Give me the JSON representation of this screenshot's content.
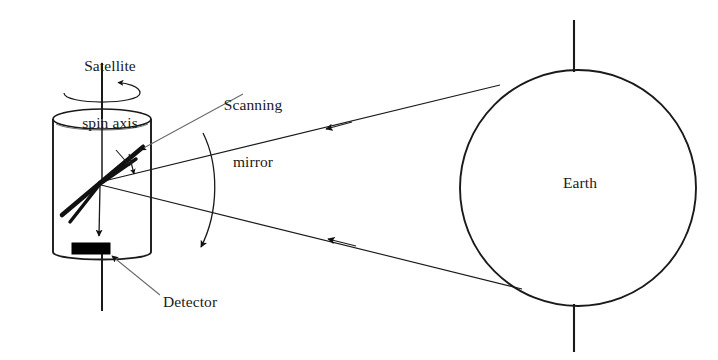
{
  "figure": {
    "background_color": "#ffffff",
    "stroke_color": "#1a1a1a",
    "fill_color": "#000000",
    "width": 718,
    "height": 360
  },
  "labels": {
    "satellite_spin_axis": "Satellite\nspin axis",
    "satellite_spin_axis_line1": "Satellite",
    "satellite_spin_axis_line2": "spin axis",
    "scanning_mirror": "Scanning\nmirror",
    "scanning_mirror_line1": "Scanning",
    "scanning_mirror_line2": "mirror",
    "detector": "Detector",
    "earth": "Earth"
  },
  "components": {
    "satellite_body": {
      "name": "satellite-cylinder",
      "shape": "cylinder",
      "center_x": 102,
      "top_y": 119,
      "bottom_y": 252,
      "radius_x": 49,
      "radius_y": 10
    },
    "spin_axis": {
      "name": "spin-axis-line",
      "x": 102,
      "top_y": 63,
      "bottom_y": 311
    },
    "spin_rotation_arrow": {
      "name": "spin-direction-arrow",
      "description": "open ellipse with arrowhead indicating spin sense",
      "center_x": 102,
      "center_y": 96,
      "radius_x": 38,
      "radius_y": 11,
      "arrow_direction": "counterclockwise-viewed-from-above"
    },
    "scanning_mirror": {
      "name": "scanning-mirror-blades",
      "pivot_x": 100,
      "pivot_y": 183,
      "blade_count": 2,
      "tilt_arrow": "double-headed"
    },
    "detector": {
      "name": "detector-block",
      "x": 72,
      "y": 243,
      "width": 38,
      "height": 11,
      "fill": "#000000"
    },
    "detector_beam": {
      "name": "detector-beam-arrow",
      "from_x": 100,
      "from_y": 185,
      "to_x": 97,
      "to_y": 240
    },
    "scan_arc": {
      "name": "scan-sweep-arc",
      "description": "curved arc with arrowhead showing mirror scan sweep",
      "top_x": 203,
      "top_y": 133,
      "bottom_x": 205,
      "bottom_y": 248
    },
    "earth": {
      "name": "earth-circle",
      "center_x": 578,
      "center_y": 188,
      "radius": 118
    },
    "earth_axis": {
      "name": "earth-polar-axis",
      "x": 574,
      "top_y": 20,
      "bottom_y": 352
    },
    "sight_line_upper": {
      "name": "upper-line-of-sight",
      "from_x": 100,
      "from_y": 182,
      "to_x": 497,
      "to_y": 86,
      "arrow_x": 332,
      "arrow_y": 127,
      "arrow_direction": "left"
    },
    "sight_line_lower": {
      "name": "lower-line-of-sight",
      "from_x": 101,
      "from_y": 185,
      "to_x": 519,
      "to_y": 288,
      "arrow_x": 332,
      "arrow_y": 240,
      "arrow_direction": "left"
    },
    "leader_scanning_mirror": {
      "name": "scanning-mirror-leader",
      "from_x": 240,
      "from_y": 96,
      "to_x": 133,
      "to_y": 155
    },
    "leader_detector": {
      "name": "detector-leader",
      "from_x": 160,
      "from_y": 294,
      "to_x": 114,
      "to_y": 257
    }
  }
}
